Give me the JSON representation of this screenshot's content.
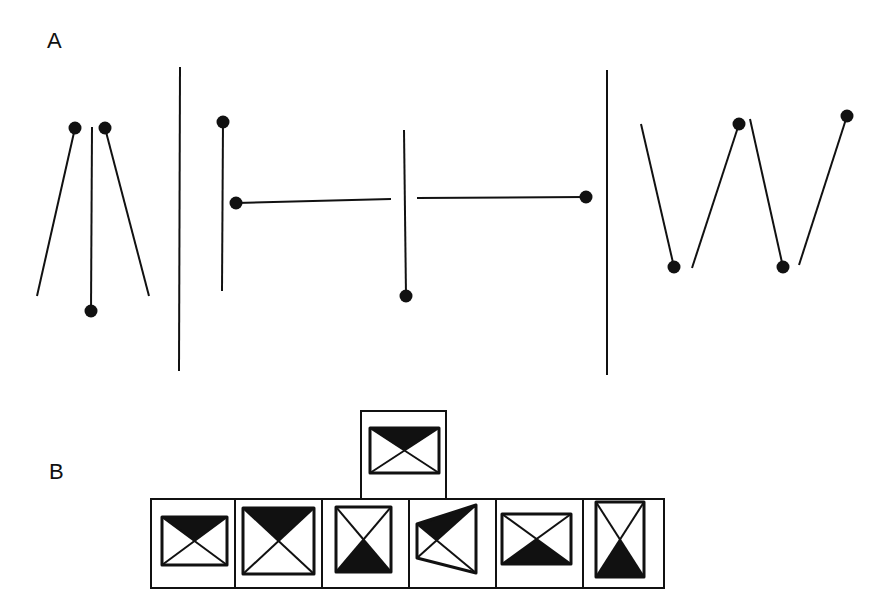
{
  "panels": {
    "a": {
      "label": "A",
      "groups": [
        {
          "name": "converging-sticks",
          "lines": [
            {
              "x1": 37,
              "y1": 296,
              "x2": 75,
              "y2": 128,
              "dot": "end"
            },
            {
              "x1": 91,
              "y1": 311,
              "x2": 92,
              "y2": 127,
              "dot": "start"
            },
            {
              "x1": 149,
              "y1": 296,
              "x2": 105,
              "y2": 128,
              "dot": "end"
            }
          ]
        },
        {
          "name": "h-sticks",
          "lines": [
            {
              "x1": 223,
              "y1": 122,
              "x2": 222,
              "y2": 291,
              "dot": "start"
            },
            {
              "x1": 236,
              "y1": 203,
              "x2": 391,
              "y2": 199,
              "dot": "start"
            },
            {
              "x1": 404,
              "y1": 130,
              "x2": 406,
              "y2": 296,
              "dot": "end"
            },
            {
              "x1": 417,
              "y1": 198,
              "x2": 586,
              "y2": 197,
              "dot": "end"
            }
          ]
        },
        {
          "name": "w-sticks",
          "lines": [
            {
              "x1": 641,
              "y1": 124,
              "x2": 674,
              "y2": 267,
              "dot": "end"
            },
            {
              "x1": 692,
              "y1": 268,
              "x2": 739,
              "y2": 124,
              "dot": "end"
            },
            {
              "x1": 750,
              "y1": 119,
              "x2": 783,
              "y2": 267,
              "dot": "end"
            },
            {
              "x1": 799,
              "y1": 265,
              "x2": 847,
              "y2": 116,
              "dot": "end"
            }
          ]
        }
      ],
      "dividers": [
        {
          "x1": 180,
          "y1": 67,
          "x2": 179,
          "y2": 371
        },
        {
          "x1": 607,
          "y1": 70,
          "x2": 607,
          "y2": 375
        }
      ]
    },
    "b": {
      "label": "B",
      "target": {
        "frame": {
          "x": 361,
          "y": 411,
          "w": 85,
          "h": 88
        },
        "shape": {
          "type": "rect",
          "x": 370,
          "y": 428,
          "w": 69,
          "h": 45,
          "shade": "top"
        }
      },
      "options": [
        {
          "frame": {
            "x": 151,
            "y": 499,
            "w": 84,
            "h": 89
          },
          "shape": {
            "type": "rect",
            "x": 162,
            "y": 517,
            "w": 65,
            "h": 48,
            "shade": "top"
          }
        },
        {
          "frame": {
            "x": 235,
            "y": 499,
            "w": 87,
            "h": 89
          },
          "shape": {
            "type": "rect",
            "x": 243,
            "y": 508,
            "w": 71,
            "h": 66,
            "shade": "top"
          }
        },
        {
          "frame": {
            "x": 322,
            "y": 499,
            "w": 87,
            "h": 89
          },
          "shape": {
            "type": "rect",
            "x": 336,
            "y": 507,
            "w": 55,
            "h": 65,
            "shade": "bottom"
          }
        },
        {
          "frame": {
            "x": 409,
            "y": 499,
            "w": 87,
            "h": 89
          },
          "shape": {
            "type": "quad",
            "points": [
              [
                417,
                524
              ],
              [
                476,
                505
              ],
              [
                476,
                573
              ],
              [
                417,
                558
              ]
            ],
            "shade": "top"
          }
        },
        {
          "frame": {
            "x": 496,
            "y": 499,
            "w": 87,
            "h": 89
          },
          "shape": {
            "type": "rect",
            "x": 502,
            "y": 514,
            "w": 69,
            "h": 50,
            "shade": "bottom"
          }
        },
        {
          "frame": {
            "x": 583,
            "y": 499,
            "w": 81,
            "h": 89
          },
          "shape": {
            "type": "rect",
            "x": 596,
            "y": 502,
            "w": 48,
            "h": 75,
            "shade": "bottom"
          }
        }
      ]
    }
  }
}
